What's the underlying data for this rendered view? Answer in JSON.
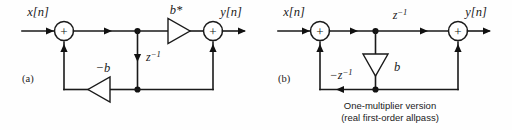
{
  "figure": {
    "background_color": "#fefefe",
    "line_color": "#1a1a1a",
    "panels": [
      {
        "tag": "(a)",
        "input_label": "x[n]",
        "output_label": "y[n]",
        "forward_gain_label": "b*",
        "feedback_gain_label": "−b",
        "delay_label": "z",
        "delay_exponent": "−1",
        "adders": [
          "+",
          "+"
        ],
        "caption": ""
      },
      {
        "tag": "(b)",
        "input_label": "x[n]",
        "output_label": "y[n]",
        "forward_delay_label": "z",
        "forward_delay_exponent": "−1",
        "gain_label": "b",
        "feedback_delay_label": "−z",
        "feedback_delay_exponent": "−1",
        "adders": [
          "+",
          "+"
        ],
        "caption_line1": "One-multiplier version",
        "caption_line2": "(real first-order allpass)"
      }
    ]
  }
}
